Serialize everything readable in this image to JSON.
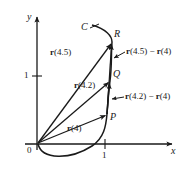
{
  "figure": {
    "kind": "vector-valued-function-diagram",
    "background_color": "#ffffff",
    "ink_color": "#1a1a1a"
  },
  "axes": {
    "x_label": "x",
    "y_label": "y",
    "origin_label": "0",
    "x_tick_label": "1",
    "y_tick_label": "1",
    "origin_px": {
      "x": 37,
      "y": 144
    },
    "unit_px": 68
  },
  "curve": {
    "name_label": "C"
  },
  "points": [
    {
      "id": "P",
      "label": "P",
      "px": {
        "x": 107,
        "y": 114
      }
    },
    {
      "id": "Q",
      "label": "Q",
      "px": {
        "x": 110,
        "y": 81
      }
    },
    {
      "id": "R",
      "label": "R",
      "px": {
        "x": 112,
        "y": 42
      }
    }
  ],
  "vectors": [
    {
      "id": "r4",
      "label_bold": "r",
      "label_arg": "(4)",
      "from": "origin",
      "to": "P"
    },
    {
      "id": "r42",
      "label_bold": "r",
      "label_arg": "(4.2)",
      "from": "origin",
      "to": "Q"
    },
    {
      "id": "r45",
      "label_bold": "r",
      "label_arg": "(4.5)",
      "from": "origin",
      "to": "R"
    },
    {
      "id": "diff42",
      "label_bold_1": "r",
      "label_arg_1": "(4.2)",
      "label_minus": " − ",
      "label_bold_2": "r",
      "label_arg_2": "(4)",
      "from": "P",
      "to": "Q"
    },
    {
      "id": "diff45",
      "label_bold_1": "r",
      "label_arg_1": "(4.5)",
      "label_minus": " − ",
      "label_bold_2": "r",
      "label_arg_2": "(4)",
      "from": "P",
      "to": "R"
    }
  ]
}
